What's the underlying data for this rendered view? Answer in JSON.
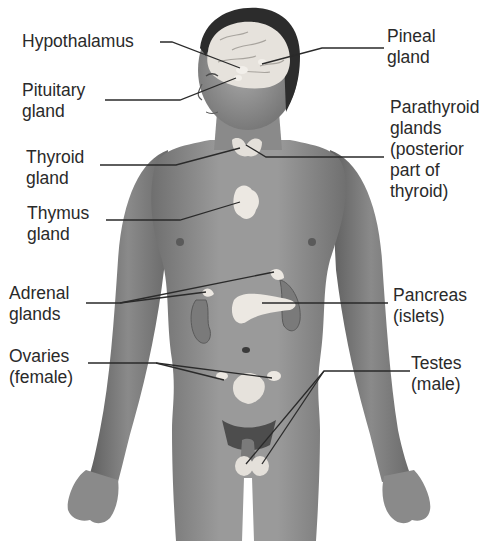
{
  "figure": {
    "colors": {
      "skin_dark": "#6a6a6a",
      "skin_mid": "#8c8c8c",
      "skin_light": "#b4b4b4",
      "gland": "#e8e4df",
      "hair": "#2c2c2c",
      "leader_line": "#2a2a2a",
      "text": "#2a2a2a",
      "background": "#ffffff"
    }
  },
  "labels": {
    "hypothalamus": {
      "text": "Hypothalamus"
    },
    "pituitary": {
      "text": "Pituitary\ngland"
    },
    "thyroid": {
      "text": "Thyroid\ngland"
    },
    "thymus": {
      "text": "Thymus\ngland"
    },
    "adrenal": {
      "text": "Adrenal\nglands"
    },
    "ovaries": {
      "text": "Ovaries\n(female)"
    },
    "pineal": {
      "text": "Pineal\ngland"
    },
    "parathyroid": {
      "text": "Parathyroid\nglands\n(posterior\npart of\nthyroid)"
    },
    "pancreas": {
      "text": "Pancreas\n(islets)"
    },
    "testes": {
      "text": "Testes\n(male)"
    }
  }
}
